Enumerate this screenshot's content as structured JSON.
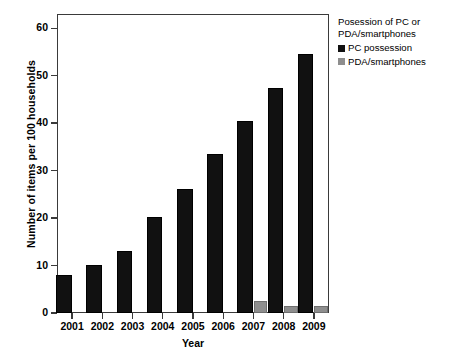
{
  "chart_data": {
    "type": "bar",
    "title": "",
    "xlabel": "Year",
    "ylabel": "Number of items per 100 households",
    "categories": [
      "2001",
      "2002",
      "2003",
      "2004",
      "2005",
      "2006",
      "2007",
      "2008",
      "2009"
    ],
    "ylim": [
      0,
      63
    ],
    "yticks": [
      0,
      10,
      20,
      30,
      40,
      50,
      60
    ],
    "ytick_labels": [
      "0",
      "10",
      "20",
      "30",
      "40",
      "50",
      "60"
    ],
    "grid": false,
    "legend_position": "right",
    "legend_title": "Posession of PC or PDA/smartphones",
    "series": [
      {
        "name": "PC possession",
        "color": "#111111",
        "values": [
          8.1,
          10.1,
          13.1,
          20.2,
          26.2,
          33.4,
          40.5,
          47.5,
          54.6
        ]
      },
      {
        "name": "PDA/smartphones",
        "color": "#8e8e8e",
        "values": [
          0,
          0,
          0,
          0,
          0,
          0,
          2.5,
          1.5,
          1.5
        ]
      }
    ]
  },
  "legend": {
    "title": "Posession of PC or PDA/smartphones",
    "items": [
      {
        "label": "PC possession",
        "swatch": "#111111"
      },
      {
        "label": "PDA/smartphones",
        "swatch": "#8e8e8e"
      }
    ]
  },
  "axes": {
    "x_title": "Year",
    "y_title": "Number of items per 100 households"
  },
  "colors": {
    "pc": "#111111",
    "pda": "#8e8e8e",
    "frame": "#3a3a3a",
    "background": "#ffffff"
  }
}
